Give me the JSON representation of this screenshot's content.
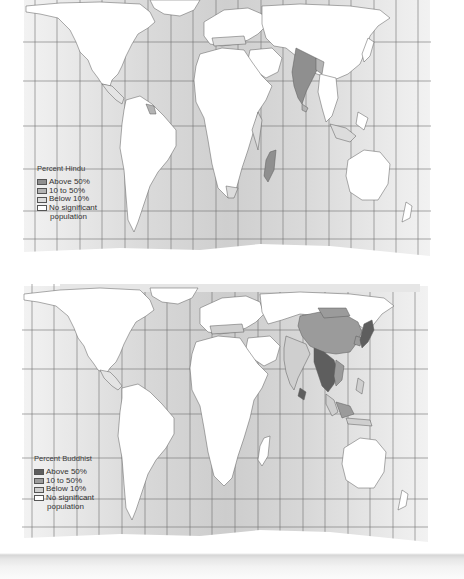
{
  "maps": [
    {
      "id": "hindu",
      "legend": {
        "title": "Percent Hindu",
        "items": [
          {
            "label": "Above 50%",
            "color": "#8f8f8f"
          },
          {
            "label": "10 to 50%",
            "color": "#b4b4b4"
          },
          {
            "label": "Below 10%",
            "color": "#dcdcdc"
          },
          {
            "label": "No significant",
            "color": "#ffffff"
          }
        ],
        "continuation": "population"
      },
      "regions": {
        "above_50": [
          "India",
          "Nepal",
          "Mauritius"
        ],
        "10_to_50": [
          "Sri Lanka",
          "Bangladesh",
          "Bhutan",
          "Guyana",
          "Suriname",
          "Trinidad and Tobago",
          "Fiji"
        ],
        "below_10": [
          "Europe",
          "Middle East",
          "East Africa",
          "South Africa",
          "Southeast Asia",
          "North America",
          "Central America"
        ]
      }
    },
    {
      "id": "buddhist",
      "legend": {
        "title": "Percent Buddhist",
        "items": [
          {
            "label": "Above 50%",
            "color": "#5e5e5e"
          },
          {
            "label": "10 to 50%",
            "color": "#9b9b9b"
          },
          {
            "label": "Below 10%",
            "color": "#cfcfcf"
          },
          {
            "label": "No significant",
            "color": "#ffffff"
          }
        ],
        "continuation": "population"
      },
      "regions": {
        "above_50": [
          "Myanmar",
          "Thailand",
          "Cambodia",
          "Laos",
          "Sri Lanka",
          "Bhutan",
          "Japan",
          "Mongolia"
        ],
        "10_to_50": [
          "China",
          "Vietnam",
          "South Korea",
          "Taiwan",
          "Singapore",
          "Malaysia"
        ],
        "below_10": [
          "India",
          "Nepal",
          "Indonesia",
          "Philippines",
          "Europe",
          "North America"
        ]
      }
    }
  ],
  "colors": {
    "ocean_light": "#e4e4e4",
    "ocean_mid": "#d2d2d2",
    "grid": "#6a6a6a",
    "land": "#ffffff",
    "border": "#555555"
  }
}
